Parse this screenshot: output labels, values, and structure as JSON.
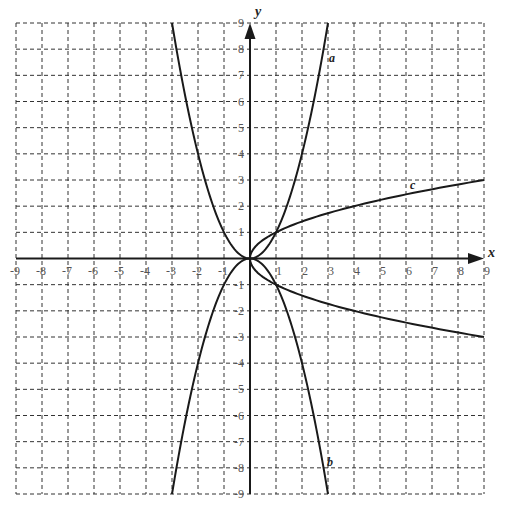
{
  "chart_data": {
    "type": "line",
    "title": "",
    "xlabel": "x",
    "ylabel": "y",
    "xlim": [
      -9,
      9
    ],
    "ylim": [
      -9,
      9
    ],
    "grid": true,
    "grid_style": "dashed",
    "x_ticks": [
      "-9",
      "-8",
      "-7",
      "-6",
      "-5",
      "-4",
      "-3",
      "-2",
      "-1",
      "1",
      "2",
      "3",
      "4",
      "5",
      "6",
      "7",
      "8",
      "9"
    ],
    "y_ticks": [
      "9",
      "8",
      "7",
      "6",
      "5",
      "4",
      "3",
      "2",
      "1",
      "-1",
      "-2",
      "-3",
      "-4",
      "-5",
      "-6",
      "-7",
      "-8",
      "-9"
    ],
    "series": [
      {
        "name": "a",
        "equation": "y = x^2",
        "x": [
          -3,
          -2,
          -1,
          0,
          1,
          2,
          3
        ],
        "y": [
          9,
          4,
          1,
          0,
          1,
          4,
          9
        ],
        "label_pos": [
          3.1,
          8
        ]
      },
      {
        "name": "b",
        "equation": "y = -x^2",
        "x": [
          -3,
          -2,
          -1,
          0,
          1,
          2,
          3
        ],
        "y": [
          -9,
          -4,
          -1,
          0,
          -1,
          -4,
          -9
        ],
        "label_pos": [
          3.1,
          -8
        ]
      },
      {
        "name": "c",
        "equation": "x = y^2 (y = ±√x)",
        "x": [
          9,
          4,
          1,
          0,
          1,
          4,
          9
        ],
        "y": [
          3,
          2,
          1,
          0,
          -1,
          -2,
          -3
        ],
        "label_pos": [
          6.2,
          2.4
        ]
      }
    ],
    "colors": {
      "curve": "#1a1a1a",
      "grid": "#333333",
      "axis": "#1a1a1a",
      "tick_text": "#555555"
    }
  },
  "labels": {
    "x_axis": "x",
    "y_axis": "y",
    "curve_a": "a",
    "curve_b": "b",
    "curve_c": "c"
  }
}
